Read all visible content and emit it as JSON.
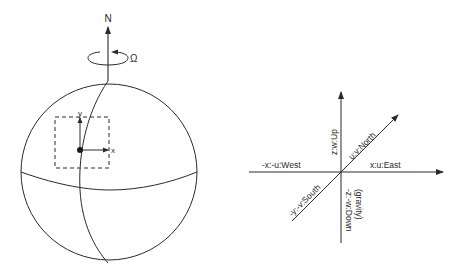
{
  "globe": {
    "pole_label": "N",
    "rotation_label": "Ω",
    "local_axes": {
      "x_label": "x",
      "y_label": "y"
    }
  },
  "frame": {
    "up_label": "z:w:Up",
    "north_label": "u:v:North",
    "east_label": "x:u:East",
    "west_label": "-x:-u:West",
    "south_label": "-y:-v:South",
    "down_label": "-z:-w:Down",
    "down_note": "(gravity)"
  },
  "colors": {
    "line": "#2a2a2a",
    "background": "#ffffff"
  }
}
